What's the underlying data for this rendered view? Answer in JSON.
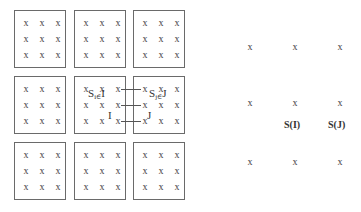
{
  "left_grid": {
    "point_glyph": "x",
    "rows": 3,
    "cols": 3,
    "points_per_box": 9,
    "center_block_label": {
      "main": "S",
      "sub": "i∈",
      "tail": "I"
    },
    "right_block_label": {
      "main": "S",
      "sub": "j∈",
      "tail": "J"
    },
    "center_node_label": "I",
    "right_node_label": "J",
    "connections": 3
  },
  "right_grid": {
    "point_glyph": "x",
    "label_I": "S(I)",
    "label_J": "S(J)"
  }
}
